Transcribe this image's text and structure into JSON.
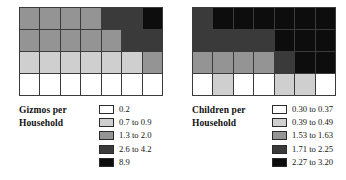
{
  "chart_data": {
    "type": "heatmap",
    "title": "",
    "panels": [
      {
        "id": "gizmos",
        "legend_title_lines": [
          "Gizmos per",
          "Household"
        ],
        "legend_title": "Gizmos per Household",
        "classes": [
          {
            "label": "0.2",
            "color": "#ffffff",
            "min": 0.2,
            "max": 0.2
          },
          {
            "label": "0.7 to 0.9",
            "color": "#cfcfcf",
            "min": 0.7,
            "max": 0.9
          },
          {
            "label": "1.3 to 2.0",
            "color": "#949494",
            "min": 1.3,
            "max": 2.0
          },
          {
            "label": "2.6 to 4.2",
            "color": "#3a3a3a",
            "min": 2.6,
            "max": 4.2
          },
          {
            "label": "8.9",
            "color": "#0d0d0d",
            "min": 8.9,
            "max": 8.9
          }
        ],
        "rows": 4,
        "cols": 7,
        "cell_classes": [
          [
            2,
            2,
            2,
            2,
            3,
            3,
            4
          ],
          [
            2,
            2,
            2,
            2,
            2,
            3,
            3
          ],
          [
            1,
            1,
            1,
            1,
            1,
            1,
            2
          ],
          [
            0,
            0,
            0,
            0,
            0,
            0,
            0
          ]
        ]
      },
      {
        "id": "children",
        "legend_title_lines": [
          "Children per",
          "Household"
        ],
        "legend_title": "Children per Household",
        "classes": [
          {
            "label": "0.30 to 0.37",
            "color": "#ffffff",
            "min": 0.3,
            "max": 0.37
          },
          {
            "label": "0.39 to 0.49",
            "color": "#cfcfcf",
            "min": 0.39,
            "max": 0.49
          },
          {
            "label": "1.53 to 1.63",
            "color": "#949494",
            "min": 1.53,
            "max": 1.63
          },
          {
            "label": "1.71 to 2.25",
            "color": "#3a3a3a",
            "min": 1.71,
            "max": 2.25
          },
          {
            "label": "2.27 to 3.20",
            "color": "#0d0d0d",
            "min": 2.27,
            "max": 3.2
          }
        ],
        "rows": 4,
        "cols": 7,
        "cell_classes": [
          [
            3,
            4,
            4,
            4,
            4,
            4,
            4
          ],
          [
            3,
            3,
            3,
            3,
            4,
            4,
            4
          ],
          [
            2,
            2,
            2,
            2,
            3,
            4,
            4
          ],
          [
            0,
            1,
            0,
            0,
            1,
            1,
            0
          ]
        ]
      }
    ],
    "grid": false,
    "legend_position": "below-right"
  }
}
